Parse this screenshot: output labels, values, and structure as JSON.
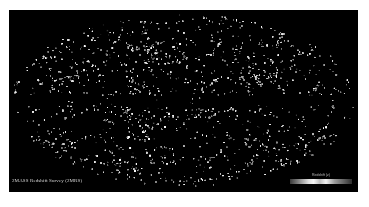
{
  "figure": {
    "title": "2MASS Redshift Survey (2MRS)",
    "projection": "aitoff",
    "background_color": "#000000",
    "page_color": "#ffffff",
    "galaxy_color": "#ffffff",
    "zone_of_avoidance": "dark horizontal band along galactic plane"
  },
  "caption": {
    "text": "2MASS Redshift Survey (2MRS)"
  },
  "colorbar": {
    "label": "Redshift (z)",
    "gradient_colors": [
      "#3a3a3a",
      "#dcdcdc",
      "#f4f4f4",
      "#bdbdbd",
      "#2e2e2e"
    ]
  }
}
